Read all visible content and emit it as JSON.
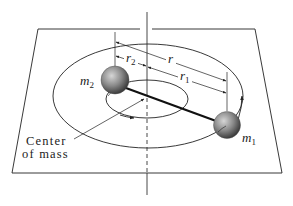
{
  "diagram": {
    "labels": {
      "m2": "m",
      "m2_sub": "2",
      "m1": "m",
      "m1_sub": "1",
      "r": "r",
      "r1": "r",
      "r1_sub": "1",
      "r2": "r",
      "r2_sub": "2",
      "center_of_mass_line1": "Center",
      "center_of_mass_line2": "of mass"
    },
    "colors": {
      "line": "#222222",
      "background": "#ffffff",
      "sphere_light": "#c8c8c8",
      "sphere_dark": "#4a4a4a"
    }
  }
}
